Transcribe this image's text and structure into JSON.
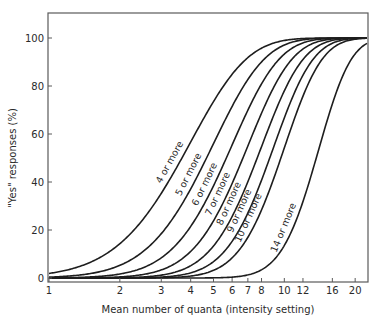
{
  "chart_data": {
    "type": "line",
    "title": "",
    "xlabel": "Mean number of quanta (intensity setting)",
    "ylabel": "\"Yes\" responses (%)",
    "x_scale": "log",
    "xlim": [
      1,
      22.8
    ],
    "ylim": [
      -3,
      110
    ],
    "grid": false,
    "legend": "none (inline curve labels)",
    "x_ticks": [
      1,
      2,
      3,
      4,
      5,
      6,
      7,
      8,
      10,
      12,
      16,
      20
    ],
    "y_ticks": [
      0,
      20,
      40,
      60,
      80,
      100
    ],
    "x": [
      1,
      1.5,
      2,
      3,
      4,
      5,
      6,
      7,
      8,
      10,
      12,
      16,
      20
    ],
    "series": [
      {
        "name": "4 or more",
        "k": 4,
        "values": [
          1.9,
          6.6,
          14.3,
          35.3,
          56.7,
          73.5,
          84.9,
          91.8,
          95.8,
          99.0,
          99.8,
          100,
          100
        ]
      },
      {
        "name": "5 or more",
        "k": 5,
        "values": [
          0.4,
          1.9,
          5.3,
          18.5,
          37.1,
          56.0,
          71.5,
          82.7,
          90.0,
          97.1,
          99.2,
          100,
          100
        ]
      },
      {
        "name": "6 or more",
        "k": 6,
        "values": [
          0.1,
          0.4,
          1.7,
          8.4,
          21.5,
          38.4,
          55.4,
          69.9,
          80.9,
          93.3,
          98.0,
          99.9,
          100
        ]
      },
      {
        "name": "7 or more",
        "k": 7,
        "values": [
          0,
          0.1,
          0.5,
          3.4,
          11.1,
          23.8,
          39.4,
          55.0,
          68.7,
          87.0,
          95.4,
          99.6,
          100
        ]
      },
      {
        "name": "8 or more",
        "k": 8,
        "values": [
          0,
          0,
          0.1,
          1.2,
          5.1,
          13.3,
          25.6,
          40.1,
          54.7,
          77.6,
          91.0,
          99.0,
          99.9
        ]
      },
      {
        "name": "9 or more",
        "k": 9,
        "values": [
          0,
          0,
          0,
          0.4,
          2.1,
          6.8,
          15.3,
          27.1,
          40.7,
          66.7,
          84.5,
          97.7,
          99.8
        ]
      },
      {
        "name": "10 or more",
        "k": 10,
        "values": [
          0,
          0,
          0,
          0.1,
          0.8,
          3.2,
          8.4,
          16.9,
          28.3,
          54.2,
          75.8,
          95.7,
          99.5
        ]
      },
      {
        "name": "14 or more",
        "k": 14,
        "values": [
          0,
          0,
          0,
          0,
          0,
          0,
          0.1,
          0.9,
          2.8,
          13.5,
          31.8,
          76.8,
          94.5
        ]
      }
    ],
    "annotations": [
      "4 or more",
      "5 or more",
      "6 or more",
      "7 or more",
      "8 or more",
      "9 or more",
      "10 or more",
      "14 or more"
    ]
  },
  "axes": {
    "x_title": "Mean number of quanta (intensity setting)",
    "y_title": "\"Yes\" responses (%)",
    "x_tick_labels": [
      "1",
      "2",
      "3",
      "4",
      "5",
      "6",
      "7",
      "8",
      "10",
      "12",
      "16",
      "20"
    ],
    "y_tick_labels": [
      "0",
      "20",
      "40",
      "60",
      "80",
      "100"
    ]
  },
  "colors": {
    "line": "#1e1e1e",
    "frame": "#5a5a5a",
    "text": "#2a2a2a"
  }
}
